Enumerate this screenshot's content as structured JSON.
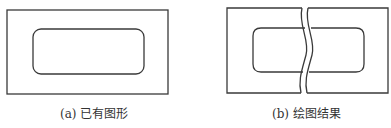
{
  "figures": [
    {
      "id": "a",
      "caption_label": "(a)",
      "caption_text": "已有图形",
      "description": "Outer rectangle containing an inner rounded rectangle"
    },
    {
      "id": "b",
      "caption_label": "(b)",
      "caption_text": "绘图结果",
      "description": "Same shapes with a wavy break line cutting vertically through them"
    }
  ],
  "colors": {
    "stroke": "#3a3a3a",
    "background": "#ffffff",
    "text": "#333333"
  }
}
